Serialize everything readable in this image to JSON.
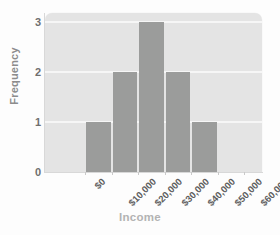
{
  "chart_data": {
    "type": "bar",
    "title": "",
    "xlabel": "Income",
    "ylabel": "Frequency",
    "bin_edges": [
      "$0",
      "$10,000",
      "$20,000",
      "$30,000",
      "$40,000",
      "$50,000",
      "$60,000"
    ],
    "categories": [
      "$10,000",
      "$20,000",
      "$30,000",
      "$40,000",
      "$50,000"
    ],
    "values": [
      1,
      2,
      3,
      2,
      1
    ],
    "bars": [
      {
        "label": "$10,000-$20,000",
        "value": 1
      },
      {
        "label": "$20,000-$30,000",
        "value": 2
      },
      {
        "label": "$30,000-$40,000",
        "value": 3
      },
      {
        "label": "$40,000-$50,000",
        "value": 2
      },
      {
        "label": "$50,000-$60,000",
        "value": 1
      }
    ],
    "yticks": [
      0,
      1,
      2,
      3
    ],
    "ytick_labels": [
      "0",
      "1",
      "2",
      "3"
    ],
    "ylim": [
      0,
      3.18
    ],
    "xtick_labels": [
      "$0",
      "$10,000",
      "$20,000",
      "$30,000",
      "$40,000",
      "$50,000",
      "$60,000"
    ],
    "grid": true,
    "gridlines_at": [
      1,
      2,
      3
    ],
    "legend": null,
    "colors": {
      "bar": "#9b9c9b",
      "plot_background": "#e4e4e4",
      "gridline": "#f6f6f6",
      "ytick_text": "#6f6f6f",
      "xtick_text": "#5e5e5e",
      "ylabel_text": "#8c8c8c",
      "xlabel_text": "#b3b3b3",
      "figure_background": "#fdfdfd"
    }
  }
}
